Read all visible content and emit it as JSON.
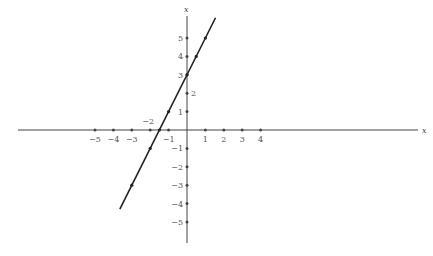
{
  "chart_data": {
    "type": "line",
    "title": "",
    "xlabel": "x",
    "ylabel": "x",
    "xlim": [
      -10,
      12
    ],
    "ylim": [
      -6,
      7
    ],
    "origin_px": [
      187,
      130
    ],
    "unit_px": 18.4,
    "x_ticks": [
      -5,
      -4,
      -3,
      -2,
      -1,
      1,
      2,
      3,
      4
    ],
    "x_tick_labels": [
      "−5",
      "−4",
      "−3",
      "−2",
      "−1",
      "1",
      "2",
      "3",
      "4"
    ],
    "y_ticks": [
      5,
      4,
      3,
      2,
      1,
      -1,
      -2,
      -3,
      -4,
      -5
    ],
    "y_tick_labels": [
      "5",
      "4",
      "3",
      "2",
      "1",
      "−1",
      "−2",
      "−3",
      "−4",
      "−5"
    ],
    "series": [
      {
        "name": "line",
        "equation": "y = 2x + 3",
        "x_range": [
          -3.65,
          1.55
        ],
        "points": [
          [
            1,
            5
          ],
          [
            0.5,
            4
          ],
          [
            0,
            3
          ],
          [
            -1,
            1
          ],
          [
            -1.5,
            0
          ],
          [
            -2,
            -1
          ],
          [
            -3,
            -3
          ]
        ]
      }
    ],
    "grid": false,
    "legend": null
  },
  "labels": {
    "x_axis_name": "x",
    "y_axis_name": "x"
  },
  "colors": {
    "axis": "#444444",
    "line": "#222222",
    "text": "#555555"
  }
}
